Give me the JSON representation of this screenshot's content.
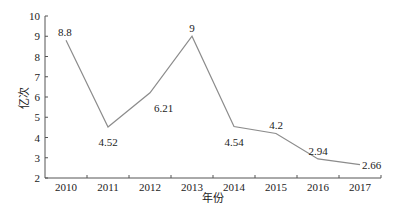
{
  "chart_data": {
    "type": "line",
    "title": "",
    "xlabel": "年份",
    "ylabel": "亿次",
    "categories": [
      "2010",
      "2011",
      "2012",
      "2013",
      "2014",
      "2015",
      "2016",
      "2017"
    ],
    "series": [
      {
        "name": "亿次",
        "values": [
          8.8,
          4.52,
          6.21,
          9,
          4.54,
          4.2,
          2.94,
          2.66
        ]
      }
    ],
    "data_labels": [
      "8.8",
      "4.52",
      "6.21",
      "9",
      "4.54",
      "4.2",
      "2.94",
      "2.66"
    ],
    "ylim": [
      2,
      10
    ],
    "yticks": [
      2,
      3,
      4,
      5,
      6,
      7,
      8,
      9,
      10
    ],
    "grid": false,
    "legend": "none",
    "line_color": "#8c8c8c"
  }
}
